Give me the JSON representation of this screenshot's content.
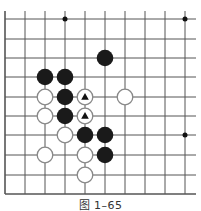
{
  "diagram": {
    "type": "go-board-fragment",
    "caption": "图 1–65",
    "grid": {
      "x_lines": [
        5,
        25,
        45,
        65,
        85,
        105,
        125,
        145,
        165,
        185
      ],
      "y_lines": [
        19,
        39,
        58,
        77,
        97,
        116,
        135,
        155,
        175,
        194
      ],
      "left_edge": true,
      "bottom_edge": true,
      "line_color": "#555555"
    },
    "star_points": [
      {
        "col": 3,
        "row": 0
      },
      {
        "col": 9,
        "row": 0
      },
      {
        "col": 9,
        "row": 6
      }
    ],
    "stones": [
      {
        "color": "black",
        "col": 5,
        "row": 2
      },
      {
        "color": "black",
        "col": 2,
        "row": 3
      },
      {
        "color": "black",
        "col": 3,
        "row": 3
      },
      {
        "color": "white",
        "col": 2,
        "row": 4
      },
      {
        "color": "black",
        "col": 3,
        "row": 4
      },
      {
        "color": "white",
        "col": 4,
        "row": 4,
        "mark": "triangle"
      },
      {
        "color": "white",
        "col": 6,
        "row": 4
      },
      {
        "color": "white",
        "col": 2,
        "row": 5
      },
      {
        "color": "black",
        "col": 3,
        "row": 5
      },
      {
        "color": "white",
        "col": 4,
        "row": 5,
        "mark": "triangle"
      },
      {
        "color": "white",
        "col": 3,
        "row": 6
      },
      {
        "color": "black",
        "col": 4,
        "row": 6
      },
      {
        "color": "black",
        "col": 5,
        "row": 6
      },
      {
        "color": "white",
        "col": 2,
        "row": 7
      },
      {
        "color": "white",
        "col": 4,
        "row": 7
      },
      {
        "color": "black",
        "col": 5,
        "row": 7
      },
      {
        "color": "white",
        "col": 4,
        "row": 8
      }
    ],
    "colors": {
      "black_stone": "#1a1a1a",
      "white_stone_fill": "#ffffff",
      "white_stone_stroke": "#888888",
      "mark": "#111111"
    }
  }
}
